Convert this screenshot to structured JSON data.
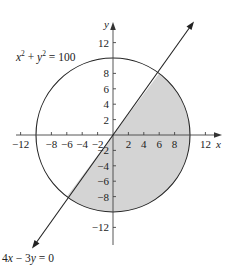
{
  "diagram": {
    "type": "graph",
    "circle": {
      "equation_parts": {
        "x": "x",
        "x_exp": "2",
        "plus": " + ",
        "y": "y",
        "y_exp": "2",
        "rhs": " = 100"
      },
      "radius": 10,
      "stroke": "#222222"
    },
    "line": {
      "equation": "4x − 3y = 0",
      "eq_parts": {
        "a": "4",
        "x": "x",
        "minus": " − 3",
        "y": "y",
        "rhs": " = 0"
      },
      "intersections": [
        [
          6,
          8
        ],
        [
          -6,
          -8
        ]
      ],
      "stroke": "#222222"
    },
    "shaded_region": {
      "description": "half-disk below/right of line 4x−3y=0 inside circle",
      "fill": "#d4d4d4"
    },
    "axes": {
      "x_label": "x",
      "y_label": "y",
      "x_ticks": [
        "−12",
        "−8",
        "−6",
        "−4",
        "−2",
        "2",
        "4",
        "6",
        "8",
        "12"
      ],
      "y_ticks_pos": [
        "12",
        "8",
        "6",
        "4",
        "2"
      ],
      "y_ticks_neg": [
        "−2",
        "−4",
        "−6",
        "−8",
        "−12"
      ]
    }
  }
}
